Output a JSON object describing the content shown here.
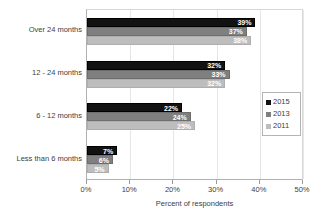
{
  "chart_data": {
    "type": "bar",
    "orientation": "horizontal",
    "title": "",
    "xlabel": "Percent of respondents",
    "ylabel": "",
    "xlim": [
      0,
      50
    ],
    "xticks": [
      "0%",
      "10%",
      "20%",
      "30%",
      "40%",
      "50%"
    ],
    "xtick_values": [
      0,
      10,
      20,
      30,
      40,
      50
    ],
    "grid": true,
    "legend_position": "right",
    "categories": [
      "Over 24 months",
      "12 - 24 months",
      "6 - 12 months",
      "Less than 6 months"
    ],
    "series": [
      {
        "name": "2015",
        "color": "#121212",
        "values": [
          39,
          32,
          22,
          7
        ],
        "labels": [
          "39%",
          "32%",
          "22%",
          "7%"
        ]
      },
      {
        "name": "2013",
        "color": "#7f7f7f",
        "values": [
          37,
          33,
          24,
          6
        ],
        "labels": [
          "37%",
          "33%",
          "24%",
          "6%"
        ]
      },
      {
        "name": "2011",
        "color": "#bdbdbd",
        "values": [
          38,
          32,
          25,
          5
        ],
        "labels": [
          "38%",
          "32%",
          "25%",
          "5%"
        ]
      }
    ]
  },
  "legend": {
    "entries": [
      {
        "label": "2015"
      },
      {
        "label": "2013"
      },
      {
        "label": "2011"
      }
    ]
  },
  "axis": {
    "x_title": "Percent of respondents"
  }
}
